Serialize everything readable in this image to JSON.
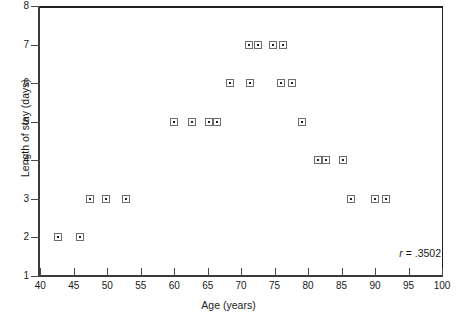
{
  "chart_data": {
    "type": "scatter",
    "title": "",
    "xlabel": "Age (years)",
    "ylabel": "Length of stay (days)",
    "xlim": [
      40,
      100
    ],
    "ylim": [
      1,
      8
    ],
    "xticks": [
      40,
      45,
      50,
      55,
      60,
      65,
      70,
      75,
      80,
      85,
      90,
      95,
      100
    ],
    "yticks": [
      1,
      2,
      3,
      4,
      5,
      6,
      7,
      8
    ],
    "grid": false,
    "legend": null,
    "marker": "square-with-center-dot",
    "annotations": [
      {
        "name": "correlation",
        "symbol": "r",
        "equals": "=",
        "value": ".3502",
        "text": "r = .3502"
      }
    ],
    "points": [
      {
        "x": 42.6,
        "y": 2
      },
      {
        "x": 45.9,
        "y": 2
      },
      {
        "x": 47.4,
        "y": 3
      },
      {
        "x": 49.8,
        "y": 3
      },
      {
        "x": 52.8,
        "y": 3
      },
      {
        "x": 59.9,
        "y": 5
      },
      {
        "x": 62.6,
        "y": 5
      },
      {
        "x": 65.2,
        "y": 5
      },
      {
        "x": 66.4,
        "y": 5
      },
      {
        "x": 68.4,
        "y": 6
      },
      {
        "x": 71.1,
        "y": 7
      },
      {
        "x": 71.3,
        "y": 6
      },
      {
        "x": 72.5,
        "y": 7
      },
      {
        "x": 74.8,
        "y": 7
      },
      {
        "x": 76.3,
        "y": 7
      },
      {
        "x": 75.9,
        "y": 6
      },
      {
        "x": 77.6,
        "y": 6
      },
      {
        "x": 79.1,
        "y": 5
      },
      {
        "x": 81.5,
        "y": 4
      },
      {
        "x": 82.7,
        "y": 4
      },
      {
        "x": 85.2,
        "y": 4
      },
      {
        "x": 86.4,
        "y": 3
      },
      {
        "x": 90.0,
        "y": 3
      },
      {
        "x": 91.6,
        "y": 3
      }
    ]
  }
}
